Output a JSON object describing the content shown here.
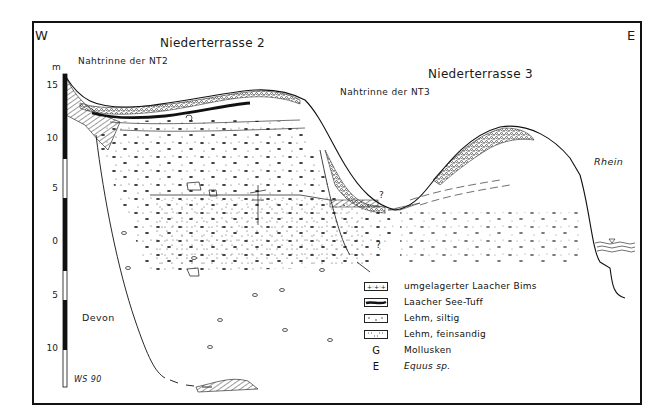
{
  "orientation": {
    "west": "W",
    "east": "E"
  },
  "terraces": {
    "nt2": {
      "title": "Niederterrasse 2",
      "channel": "Nahtrinne der NT2"
    },
    "nt3": {
      "title": "Niederterrasse 3",
      "channel": "Nahtrinne der NT3"
    }
  },
  "scale": {
    "unit": "m",
    "ticks": [
      "15",
      "10",
      "5",
      "0",
      "5",
      "10"
    ]
  },
  "annotations": {
    "bedrock": "Devon",
    "river": "Rhein",
    "uncertain_1": "?",
    "uncertain_2": "?",
    "author": "WS 90"
  },
  "legend": [
    {
      "symbol": "pumice-swatch",
      "label": "umgelagerter Laacher Bims"
    },
    {
      "symbol": "tuff-swatch",
      "label": "Laacher See-Tuff"
    },
    {
      "symbol": "silty-loam-swatch",
      "label": "Lehm, siltig"
    },
    {
      "symbol": "sandy-loam-swatch",
      "label": "Lehm, feinsandig"
    },
    {
      "symbol": "G",
      "label": "Mollusken"
    },
    {
      "symbol": "E",
      "label": "Equus sp."
    }
  ],
  "colors": {
    "ink": "#1a1a1a",
    "paper": "#ffffff"
  }
}
